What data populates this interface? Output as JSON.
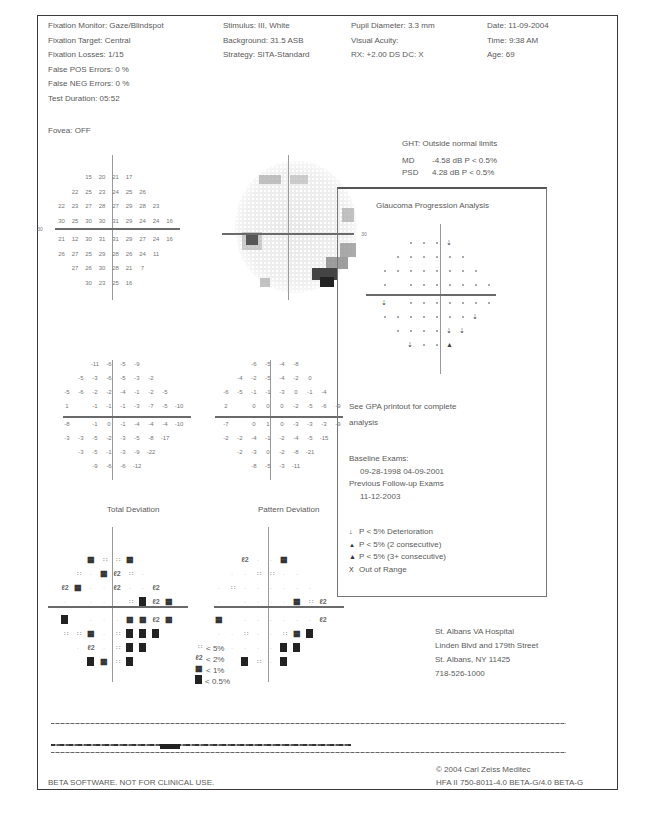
{
  "header": {
    "col1": [
      "Fixation Monitor: Gaze/Blindspot",
      "Fixation Target: Central",
      "Fixation Losses: 1/15",
      "False POS Errors:  0 %",
      "False NEG Errors:  0 %",
      "Test Duration: 05:52"
    ],
    "col2": [
      "Stimulus: III, White",
      "Background: 31.5 ASB",
      "Strategy: SITA-Standard"
    ],
    "col3": [
      "Pupil Diameter: 3.3 mm",
      "Visual Acuity:",
      "RX: +2.00 DS      DC: X"
    ],
    "col4": [
      "Date: 11-09-2004",
      "Time: 9:38 AM",
      "Age: 69"
    ],
    "fovea": "Fovea: OFF"
  },
  "global_indices": {
    "ght": "GHT: Outside normal limits",
    "md_label": "MD",
    "md_value": "-4.58 dB  P < 0.5%",
    "psd_label": "PSD",
    "psd_value": "4.28 dB  P < 0.5%"
  },
  "threshold_map": {
    "axis_label": "30",
    "rows": [
      [
        "",
        "",
        "",
        "15",
        "20",
        "21",
        "17",
        "",
        "",
        ""
      ],
      [
        "",
        "",
        "22",
        "25",
        "23",
        "24",
        "25",
        "26",
        "",
        ""
      ],
      [
        "",
        "22",
        "23",
        "27",
        "28",
        "27",
        "29",
        "28",
        "23",
        ""
      ],
      [
        "",
        "30",
        "25",
        "30",
        "30",
        "31",
        "29",
        "24",
        "24",
        "16"
      ],
      [
        "",
        "21",
        "12",
        "30",
        "31",
        "31",
        "29",
        "27",
        "24",
        "16"
      ],
      [
        "",
        "26",
        "27",
        "25",
        "29",
        "28",
        "26",
        "24",
        "11",
        ""
      ],
      [
        "",
        "",
        "27",
        "26",
        "30",
        "28",
        "21",
        "7",
        "",
        ""
      ],
      [
        "",
        "",
        "",
        "30",
        "23",
        "25",
        "16",
        "",
        "",
        ""
      ]
    ]
  },
  "grayscale_map": {
    "axis_label": "30"
  },
  "total_deviation_values": {
    "rows": [
      [
        "",
        "",
        "",
        "-11",
        "-6",
        "-5",
        "-9",
        "",
        "",
        ""
      ],
      [
        "",
        "",
        "-5",
        "-3",
        "-6",
        "-5",
        "-3",
        "-2",
        "",
        ""
      ],
      [
        "",
        "-5",
        "-6",
        "-2",
        "-2",
        "-4",
        "-1",
        "-2",
        "-5",
        ""
      ],
      [
        "",
        "1",
        "",
        "-1",
        "-1",
        "-1",
        "-3",
        "-7",
        "-5",
        "-10"
      ],
      [
        "",
        "-8",
        "",
        "-1",
        "0",
        "-1",
        "-4",
        "-4",
        "-4",
        "-10"
      ],
      [
        "",
        "-3",
        "-3",
        "-5",
        "-2",
        "-3",
        "-5",
        "-8",
        "-17",
        ""
      ],
      [
        "",
        "",
        "-3",
        "-5",
        "-1",
        "-3",
        "-9",
        "-22",
        "",
        ""
      ],
      [
        "",
        "",
        "",
        "-9",
        "-6",
        "-6",
        "-12",
        "",
        "",
        ""
      ]
    ]
  },
  "pattern_deviation_values": {
    "rows": [
      [
        "",
        "",
        "",
        "-6",
        "-5",
        "-4",
        "-8",
        "",
        "",
        ""
      ],
      [
        "",
        "",
        "-4",
        "-2",
        "-5",
        "-4",
        "-2",
        "0",
        "",
        ""
      ],
      [
        "",
        "-6",
        "-5",
        "-1",
        "-1",
        "-3",
        "0",
        "-1",
        "-4",
        ""
      ],
      [
        "",
        "2",
        "",
        "0",
        "0",
        "0",
        "-2",
        "-5",
        "-6",
        "-9"
      ],
      [
        "",
        "-7",
        "",
        "0",
        "1",
        "0",
        "-3",
        "-3",
        "-3",
        "-9"
      ],
      [
        "",
        "-2",
        "-2",
        "-4",
        "-1",
        "-2",
        "-4",
        "-5",
        "-15",
        ""
      ],
      [
        "",
        "",
        "-2",
        "-3",
        "0",
        "-2",
        "-8",
        "-21",
        "",
        ""
      ],
      [
        "",
        "",
        "",
        "-8",
        "-5",
        "-3",
        "-11",
        "",
        "",
        ""
      ]
    ]
  },
  "total_deviation_plot": {
    "title": "Total Deviation",
    "rows": [
      [
        "",
        "",
        "",
        "p1",
        "p5",
        "p5",
        "p1",
        "",
        "",
        ""
      ],
      [
        "",
        "",
        "p5",
        "dot",
        "p1",
        "p2",
        "p5",
        "dot",
        "",
        ""
      ],
      [
        "",
        "p2",
        "p1",
        "dot",
        "dot",
        "p2",
        "dot",
        "dot",
        "p2",
        ""
      ],
      [
        "",
        "dot",
        "",
        "dot",
        "dot",
        "dot",
        "p5",
        "p05",
        "p2",
        "p1"
      ],
      [
        "",
        "p05",
        "",
        "dot",
        "dot",
        "dot",
        "p1",
        "p1",
        "p2",
        "p1"
      ],
      [
        "",
        "p5",
        "p5",
        "p1",
        "dot",
        "p5",
        "p05",
        "p05",
        "p05",
        ""
      ],
      [
        "",
        "",
        "dot",
        "p2",
        "dot",
        "p5",
        "p05",
        "p05",
        "",
        ""
      ],
      [
        "",
        "",
        "",
        "p05",
        "p1",
        "p5",
        "p05",
        "",
        "",
        ""
      ]
    ]
  },
  "pattern_deviation_plot": {
    "title": "Pattern Deviation",
    "rows": [
      [
        "",
        "",
        "",
        "p2",
        "dot",
        "dot",
        "p1",
        "",
        "",
        ""
      ],
      [
        "",
        "",
        "dot",
        "dot",
        "p5",
        "p5",
        "dot",
        "dot",
        "",
        ""
      ],
      [
        "",
        "dot",
        "p5",
        "dot",
        "dot",
        "dot",
        "dot",
        "dot",
        "dot",
        ""
      ],
      [
        "",
        "dot",
        "",
        "dot",
        "dot",
        "dot",
        "dot",
        "p1",
        "p5",
        "p2"
      ],
      [
        "",
        "p1",
        "",
        "dot",
        "dot",
        "dot",
        "dot",
        "dot",
        "dot",
        "p2"
      ],
      [
        "",
        "dot",
        "dot",
        "p5",
        "dot",
        "dot",
        "p5",
        "p1",
        "p05",
        ""
      ],
      [
        "",
        "",
        "dot",
        "dot",
        "dot",
        "dot",
        "p05",
        "p05",
        "",
        ""
      ],
      [
        "",
        "",
        "",
        "p05",
        "p5",
        "dot",
        "p05",
        "",
        "",
        ""
      ]
    ]
  },
  "probability_legend": [
    {
      "symbol": "p5",
      "label": "< 5%"
    },
    {
      "symbol": "p2",
      "label": "< 2%"
    },
    {
      "symbol": "p1",
      "label": "< 1%"
    },
    {
      "symbol": "p05",
      "label": "< 0.5%"
    }
  ],
  "gpa": {
    "title": "Glaucoma Progression Analysis",
    "note_line1": "See GPA printout for complete",
    "note_line2": "analysis",
    "baseline_label": "Baseline Exams:",
    "baseline_dates": "09-28-1998      04-09-2001",
    "followup_label": "Previous Follow-up Exams",
    "followup_dates": "11-12-2003",
    "rows": [
      [
        "",
        "",
        "",
        "dot",
        "dot",
        "dot",
        "tri",
        "",
        "",
        ""
      ],
      [
        "",
        "",
        "dot",
        "dot",
        "dot",
        "dot",
        "dot",
        "dot",
        "",
        ""
      ],
      [
        "",
        "dot",
        "dot",
        "dot",
        "dot",
        "dot",
        "dot",
        "dot",
        "dot",
        ""
      ],
      [
        "",
        "dot",
        "",
        "dot",
        "dot",
        "dot",
        "dot",
        "dot",
        "dot",
        "dot"
      ],
      [
        "",
        "tri",
        "",
        "dot",
        "dot",
        "dot",
        "dot",
        "dot",
        "dot",
        "dot"
      ],
      [
        "",
        "dot",
        "dot",
        "dot",
        "dot",
        "dot",
        "dot",
        "dot",
        "tri",
        ""
      ],
      [
        "",
        "",
        "dot",
        "dot",
        "dot",
        "dot",
        "tri",
        "tri",
        "",
        ""
      ],
      [
        "",
        "",
        "",
        "tri",
        "dot",
        "dot",
        "tri2",
        "",
        "",
        ""
      ]
    ],
    "legend": [
      {
        "glyph": "↓",
        "label": "P < 5% Deterioration"
      },
      {
        "glyph": "▲",
        "label": "P < 5% (2 consecutive)"
      },
      {
        "glyph": "▲",
        "label": "P < 5% (3+ consecutive)"
      },
      {
        "glyph": "X",
        "label": "Out of Range"
      }
    ]
  },
  "institution": {
    "line1": "St. Albans VA Hospital",
    "line2": "Linden Blvd and 179th Street",
    "line3": "St. Albans, NY 11425",
    "line4": "718-526-1000"
  },
  "footer": {
    "beta_notice": "BETA SOFTWARE. NOT FOR CLINICAL USE.",
    "copyright": "© 2004 Carl Zeiss Meditec",
    "version": "HFA II 750-8011-4.0 BETA-G/4.0 BETA-G"
  }
}
